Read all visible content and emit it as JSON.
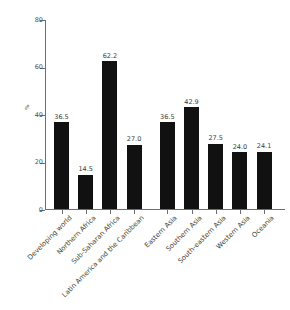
{
  "chart_data": {
    "type": "bar",
    "title": "",
    "xlabel": "",
    "ylabel": "%",
    "ylim": [
      0,
      80
    ],
    "yticks": [
      0,
      20,
      40,
      60,
      80
    ],
    "grid": false,
    "legend": null,
    "categories": [
      "Developing world",
      "Northern Africa",
      "Sub-Saharan Africa",
      "Latin America and the Caribbean",
      "Eastern Asia",
      "Southern Asia",
      "South-eastern Asia",
      "Western Asia",
      "Oceania"
    ],
    "values": [
      36.5,
      14.5,
      62.2,
      27.0,
      36.5,
      42.9,
      27.5,
      24.0,
      24.1
    ],
    "value_labels": [
      "36.5",
      "14.5",
      "62.2",
      "27.0",
      "36.5",
      "42.9",
      "27.5",
      "24.0",
      "24.1"
    ],
    "bar_color": "#111111",
    "axis_color": "#6e6e6e",
    "text_color": "#3f3f3f",
    "group_break_after_index": 3
  },
  "axis": {
    "y_label": "%",
    "y_tick_labels": [
      "0",
      "20",
      "40",
      "60",
      "80"
    ]
  }
}
